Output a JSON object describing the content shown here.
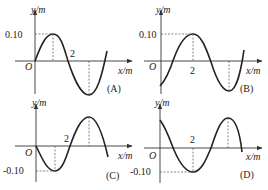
{
  "figure": {
    "panels": [
      {
        "id": "A",
        "label": "(A)",
        "y_axis_label": "y/m",
        "x_axis_label": "x/m",
        "origin_label": "O",
        "amplitude_label": "0.10",
        "x_tick_label": "2",
        "description": "Sine wave starting at origin going up; peak +0.10 at quarter wavelength; crosses zero at x=2"
      },
      {
        "id": "B",
        "label": "(B)",
        "y_axis_label": "y/m",
        "x_axis_label": "x/m",
        "origin_label": "O",
        "amplitude_label": "0.10",
        "x_tick_label": "2",
        "description": "Wave starting below axis; peak +0.10 at x=2"
      },
      {
        "id": "C",
        "label": "(C)",
        "y_axis_label": "y/m",
        "x_axis_label": "x/m",
        "origin_label": "O",
        "amplitude_label": "-0.10",
        "x_tick_label": "2",
        "description": "Sine wave starting at origin going down; trough -0.10 at quarter wavelength; crosses zero at x=2"
      },
      {
        "id": "D",
        "label": "(D)",
        "y_axis_label": "y/m",
        "x_axis_label": "x/m",
        "origin_label": "O",
        "amplitude_label": "-0.10",
        "x_tick_label": "2",
        "description": "Wave starting above axis; trough -0.10 at x=2"
      }
    ]
  }
}
